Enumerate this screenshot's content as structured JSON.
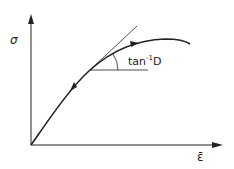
{
  "diagram": {
    "type": "stress-strain curve with tangent",
    "y_axis_label": "σ",
    "x_axis_label": "ε̄",
    "angle_label_base": "tan",
    "angle_label_sup": "-1",
    "angle_label_tail": "D",
    "colors": {
      "stroke": "#222222",
      "background": "#ffffff"
    }
  }
}
